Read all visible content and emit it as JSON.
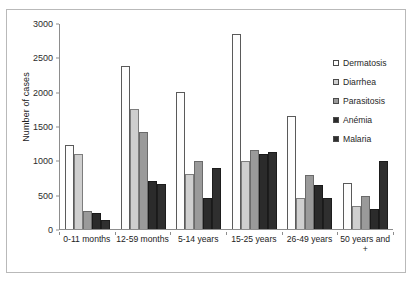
{
  "chart_data": {
    "type": "bar",
    "title": "",
    "xlabel": "",
    "ylabel": "Number of cases",
    "ylim": [
      0,
      3000
    ],
    "ytick_step": 500,
    "yticks": [
      "0",
      "500",
      "1000",
      "1500",
      "2000",
      "2500",
      "3000"
    ],
    "grid": false,
    "legend_position": "right-inside",
    "categories": [
      "0-11 months",
      "12-59 months",
      "5-14 years",
      "15-25 years",
      "26-49 years",
      "50 years and +"
    ],
    "series": [
      {
        "name": "Dermatosis",
        "pattern": "white-speckled",
        "color": "#fdfdfd",
        "values": [
          1230,
          2380,
          2000,
          2850,
          1660,
          680
        ]
      },
      {
        "name": "Diarrhea",
        "pattern": "light-grey-speckled",
        "color": "#cfcfcf",
        "values": [
          1100,
          1750,
          800,
          1000,
          450,
          330
        ]
      },
      {
        "name": "Parasitosis",
        "pattern": "solid-mid-grey",
        "color": "#9a9a9a",
        "values": [
          270,
          1420,
          1000,
          1150,
          790,
          480
        ]
      },
      {
        "name": "Anémia",
        "pattern": "solid-dark",
        "color": "#2b2b2b",
        "values": [
          230,
          700,
          460,
          1100,
          640,
          300
        ]
      },
      {
        "name": "Malaria",
        "pattern": "dark-white-dots",
        "color": "#2f2f2f",
        "values": [
          130,
          660,
          890,
          1120,
          450,
          1000
        ]
      }
    ]
  }
}
